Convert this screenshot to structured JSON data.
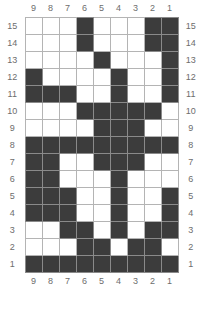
{
  "chart_data": {
    "type": "table",
    "title": "",
    "xlabel": "",
    "ylabel": "",
    "grid": true,
    "legend": "none",
    "columns": 9,
    "rows": 15,
    "column_labels_top": [
      "9",
      "8",
      "7",
      "6",
      "5",
      "4",
      "3",
      "2",
      "1"
    ],
    "column_labels_bottom": [
      "9",
      "8",
      "7",
      "6",
      "5",
      "4",
      "3",
      "2",
      "1"
    ],
    "row_labels_left": [
      "15",
      "14",
      "13",
      "12",
      "11",
      "10",
      "9",
      "8",
      "7",
      "6",
      "5",
      "4",
      "3",
      "2",
      "1"
    ],
    "row_labels_right": [
      "15",
      "14",
      "13",
      "12",
      "11",
      "10",
      "9",
      "8",
      "7",
      "6",
      "5",
      "4",
      "3",
      "2",
      "1"
    ],
    "fill_color": "#3c3c3c",
    "empty_color": "#ffffff",
    "gridline_color": "#b4b4b4",
    "label_color": "#6d6d6d",
    "cells": [
      {
        "row_label": "15",
        "values": [
          0,
          0,
          0,
          1,
          0,
          0,
          0,
          1,
          1
        ]
      },
      {
        "row_label": "14",
        "values": [
          0,
          0,
          0,
          1,
          0,
          0,
          0,
          1,
          1
        ]
      },
      {
        "row_label": "13",
        "values": [
          0,
          0,
          0,
          0,
          1,
          0,
          0,
          0,
          1
        ]
      },
      {
        "row_label": "12",
        "values": [
          1,
          0,
          0,
          0,
          0,
          1,
          0,
          0,
          1
        ]
      },
      {
        "row_label": "11",
        "values": [
          1,
          1,
          1,
          0,
          0,
          1,
          0,
          0,
          1
        ]
      },
      {
        "row_label": "10",
        "values": [
          0,
          0,
          0,
          1,
          1,
          1,
          1,
          1,
          0
        ]
      },
      {
        "row_label": "9",
        "values": [
          0,
          0,
          0,
          0,
          1,
          1,
          1,
          0,
          0
        ]
      },
      {
        "row_label": "8",
        "values": [
          1,
          1,
          1,
          1,
          1,
          1,
          1,
          1,
          1
        ]
      },
      {
        "row_label": "7",
        "values": [
          1,
          1,
          0,
          0,
          1,
          1,
          1,
          0,
          0
        ]
      },
      {
        "row_label": "6",
        "values": [
          1,
          1,
          0,
          0,
          0,
          1,
          0,
          0,
          0
        ]
      },
      {
        "row_label": "5",
        "values": [
          1,
          1,
          1,
          0,
          0,
          1,
          0,
          0,
          1
        ]
      },
      {
        "row_label": "4",
        "values": [
          1,
          1,
          1,
          0,
          0,
          1,
          0,
          0,
          1
        ]
      },
      {
        "row_label": "3",
        "values": [
          0,
          0,
          1,
          1,
          0,
          1,
          0,
          1,
          1
        ]
      },
      {
        "row_label": "2",
        "values": [
          0,
          0,
          0,
          1,
          1,
          0,
          1,
          1,
          0
        ]
      },
      {
        "row_label": "1",
        "values": [
          1,
          1,
          1,
          1,
          1,
          1,
          1,
          1,
          1
        ]
      }
    ]
  }
}
